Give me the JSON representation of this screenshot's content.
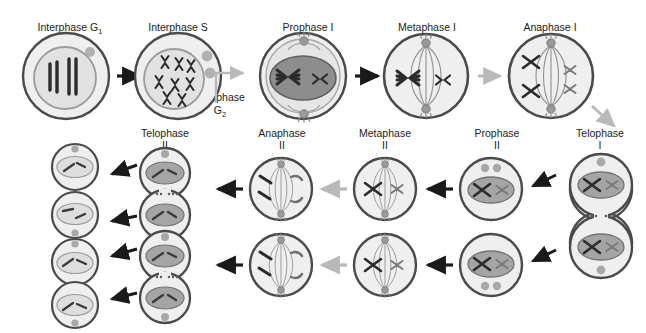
{
  "diagram": {
    "background": "#ffffff",
    "colors": {
      "outline": "#3f3f3f",
      "cytoplasm": "#efefef",
      "nucleus_light": "#e0e0e0",
      "nucleus_mid": "#b4b4b4",
      "nucleus_dark": "#8d8d8d",
      "chromosome": "#2b2b2b",
      "chromosome_gray": "#777777",
      "arrow_dark": "#1a1a1a",
      "arrow_light": "#b9b9b9",
      "centriole": "#9a9a9a"
    }
  },
  "labels": {
    "interphase_g1": "Interphase G",
    "interphase_g1_sub": "1",
    "interphase_s": "Interphase S",
    "interphase_g2_line1": "Interphase",
    "interphase_g2_line2": "G",
    "interphase_g2_sub": "2",
    "prophase_1": "Prophase I",
    "metaphase_1": "Metaphase I",
    "anaphase_1": "Anaphase I",
    "telophase_1_line1": "Telophase",
    "telophase_1_line2": "I",
    "prophase_2_line1": "Prophase",
    "prophase_2_line2": "II",
    "metaphase_2_line1": "Metaphase",
    "metaphase_2_line2": "II",
    "anaphase_2_line1": "Anaphase",
    "anaphase_2_line2": "II",
    "telophase_2_line1": "Telophase",
    "telophase_2_line2": "II"
  },
  "stages": [
    {
      "id": "interphase-g1",
      "label": "Interphase G1",
      "row": 1,
      "order": 1,
      "cell": "single-round",
      "nucleus": "light",
      "chromosomes": "4 unduplicated rods",
      "centrioles": 1
    },
    {
      "id": "interphase-s",
      "label": "Interphase S",
      "row": 1,
      "order": 2,
      "cell": "single-round",
      "nucleus": "light",
      "chromosomes": "6 duplicated X shapes",
      "centrioles": 2
    },
    {
      "id": "prophase-i",
      "label": "Prophase I",
      "row": 1,
      "order": 3,
      "cell": "single-round",
      "nucleus": "dark-ellipse",
      "chromosomes": "2 tetrad pairs",
      "centrioles": 2
    },
    {
      "id": "metaphase-i",
      "label": "Metaphase I",
      "row": 1,
      "order": 4,
      "cell": "spindle",
      "nucleus": "none",
      "chromosomes": "2 tetrads at equator",
      "centrioles": 2
    },
    {
      "id": "anaphase-i",
      "label": "Anaphase I",
      "row": 1,
      "order": 5,
      "cell": "spindle",
      "nucleus": "none",
      "chromosomes": "4 separating homologs",
      "centrioles": 2
    },
    {
      "id": "telophase-i",
      "label": "Telophase I",
      "row": 2,
      "order": 1,
      "cell": "dumbbell",
      "nucleus": "mid-ellipse",
      "chromosomes": "2 X shapes per cell",
      "centrioles": 2
    },
    {
      "id": "prophase-ii",
      "label": "Prophase II",
      "row": 2,
      "order": 2,
      "cell": "two-round",
      "nucleus": "mid-ellipse",
      "chromosomes": "2 X shapes per cell",
      "centrioles": 2
    },
    {
      "id": "metaphase-ii",
      "label": "Metaphase II",
      "row": 2,
      "order": 3,
      "cell": "two-spindle",
      "nucleus": "none",
      "chromosomes": "2 X shapes at equator",
      "centrioles": 2
    },
    {
      "id": "anaphase-ii",
      "label": "Anaphase II",
      "row": 2,
      "order": 4,
      "cell": "two-spindle",
      "nucleus": "none",
      "chromosomes": "4 separating chromatids",
      "centrioles": 2
    },
    {
      "id": "telophase-ii",
      "label": "Telophase II",
      "row": 2,
      "order": 5,
      "cell": "two-dumbbell",
      "nucleus": "mid-ellipse",
      "chromosomes": "2 rods per cell",
      "centrioles": 2
    },
    {
      "id": "gametes",
      "label": "Gametes",
      "row": 3,
      "order": 1,
      "cell": "four-round",
      "nucleus": "light-ellipse",
      "chromosomes": "2 rods per cell",
      "centrioles": 1
    }
  ],
  "arrows": [
    {
      "id": "a1",
      "from": "interphase-g1",
      "to": "interphase-s",
      "style": "dark",
      "direction": "right"
    },
    {
      "id": "a2",
      "from": "interphase-s",
      "to": "prophase-i",
      "style": "light",
      "direction": "right",
      "note": "Interphase G2"
    },
    {
      "id": "a3",
      "from": "prophase-i",
      "to": "metaphase-i",
      "style": "dark",
      "direction": "right"
    },
    {
      "id": "a4",
      "from": "metaphase-i",
      "to": "anaphase-i",
      "style": "light",
      "direction": "right"
    },
    {
      "id": "a5",
      "from": "anaphase-i",
      "to": "telophase-i",
      "style": "light",
      "direction": "down-right"
    },
    {
      "id": "a6",
      "from": "telophase-i",
      "to": "prophase-ii",
      "style": "dark",
      "direction": "left"
    },
    {
      "id": "a7",
      "from": "prophase-ii",
      "to": "metaphase-ii",
      "style": "dark",
      "direction": "left"
    },
    {
      "id": "a8",
      "from": "metaphase-ii",
      "to": "anaphase-ii",
      "style": "light",
      "direction": "left"
    },
    {
      "id": "a9",
      "from": "anaphase-ii",
      "to": "telophase-ii",
      "style": "dark",
      "direction": "left"
    },
    {
      "id": "a10",
      "from": "telophase-ii",
      "to": "gametes",
      "style": "dark",
      "direction": "left"
    }
  ]
}
